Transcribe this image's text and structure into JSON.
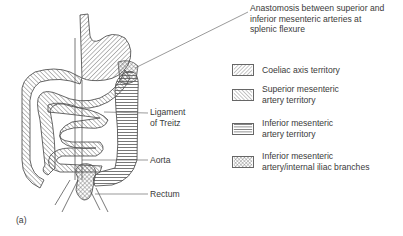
{
  "figure": {
    "panel_label": "(a)",
    "callouts": {
      "anastomosis": [
        "Anastomosis between superior and",
        "inferior mesenteric arteries at",
        "splenic flexure"
      ],
      "ligament": [
        "Ligament",
        "of Treitz"
      ],
      "aorta": "Aorta",
      "rectum": "Rectum"
    },
    "legend": [
      {
        "pattern": "diagonal-right-hatch",
        "lines": [
          "Coeliac axis territory"
        ]
      },
      {
        "pattern": "diagonal-left-hatch",
        "lines": [
          "Superior mesenteric",
          "artery territory"
        ]
      },
      {
        "pattern": "horizontal-hatch",
        "lines": [
          "Inferior mesenteric",
          "artery territory"
        ]
      },
      {
        "pattern": "cross-hatch",
        "lines": [
          "Inferior mesenteric",
          "artery/internal iliac branches"
        ]
      }
    ],
    "colors": {
      "stroke": "#555555",
      "text": "#3a3a3a",
      "background": "#ffffff"
    }
  }
}
